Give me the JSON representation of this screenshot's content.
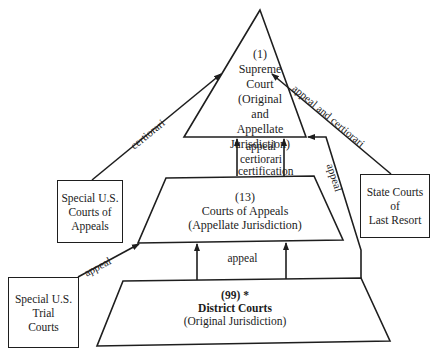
{
  "diagram": {
    "supreme_court": {
      "count": "(1)",
      "name_line1": "Supreme",
      "name_line2": "Court",
      "jurisdiction_line1": "(Original",
      "jurisdiction_line2": "and",
      "jurisdiction_line3": "Appellate",
      "jurisdiction_line4": "Jurisdiction)"
    },
    "courts_of_appeals": {
      "count": "(13)",
      "name": "Courts of Appeals",
      "jurisdiction": "(Appellate Jurisdiction)"
    },
    "district_courts": {
      "count": "(99) *",
      "name": "District Courts",
      "jurisdiction": "(Original Jurisdiction)"
    },
    "side_boxes": {
      "special_courts_of_appeals": "Special U.S.\nCourts of\nAppeals",
      "state_courts": "State Courts\nof\nLast Resort",
      "special_trial_courts": "Special U.S.\nTrial\nCourts"
    },
    "edges": {
      "appeals_to_supreme_line1": "appeal",
      "appeals_to_supreme_line2": "certiorari",
      "appeals_to_supreme_line3": "certification",
      "district_to_appeals": "appeal",
      "special_appeals_to_supreme": "certiorari",
      "state_to_supreme": "appeal and certiorari",
      "district_to_supreme": "appeal",
      "special_trial_to_appeals": "appeal"
    },
    "colors": {
      "line": "#1e1e1e",
      "background": "#ffffff"
    }
  }
}
